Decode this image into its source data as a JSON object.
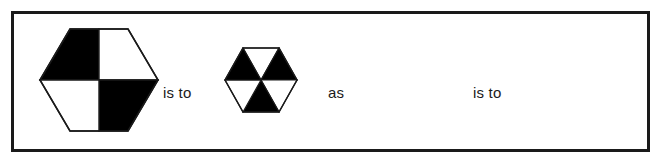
{
  "puzzle": {
    "type": "visual-analogy",
    "connectors": {
      "is_to_1": "is to",
      "as": "as",
      "is_to_2": "is to"
    },
    "frame": {
      "border_color": "#1a1a1a",
      "border_width_px": 3,
      "background_color": "#ffffff"
    },
    "colors": {
      "fill_black": "#000000",
      "fill_white": "#ffffff",
      "outline": "#1a1a1a",
      "text": "#1b1b1b"
    },
    "figures": [
      {
        "id": "figure-a",
        "label": "hexagon-quartered",
        "shape": "hexagon",
        "orientation": "pointy-left-right",
        "divisions": 4,
        "division_style": "vertical-and-horizontal-bisectors",
        "segment_fills": [
          "black",
          "white",
          "black",
          "white"
        ],
        "segment_names": [
          "top-left",
          "top-right",
          "bottom-right",
          "bottom-left"
        ],
        "size_px": {
          "width": 118,
          "height": 102
        }
      },
      {
        "id": "figure-b",
        "label": "hexagon-six-sectors-alternating",
        "shape": "hexagon",
        "orientation": "pointy-left-right",
        "divisions": 6,
        "division_style": "radial-sectors-from-center",
        "segment_fills": [
          "white",
          "black",
          "white",
          "black",
          "white",
          "black"
        ],
        "segment_names": [
          "top",
          "upper-right",
          "lower-right",
          "bottom",
          "lower-left",
          "upper-left"
        ],
        "size_px": {
          "width": 70,
          "height": 61
        }
      },
      {
        "id": "figure-c",
        "label": "blank-prompt-slot",
        "shape": "none",
        "content": ""
      },
      {
        "id": "figure-d",
        "label": "blank-answer-slot",
        "shape": "none",
        "content": ""
      }
    ]
  }
}
